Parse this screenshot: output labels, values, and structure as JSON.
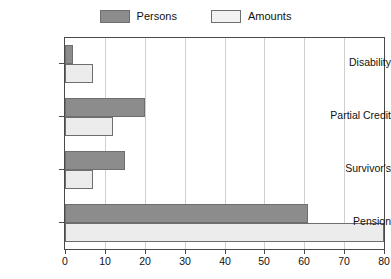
{
  "chart_data": {
    "type": "bar",
    "orientation": "horizontal",
    "title": "",
    "xlabel": "",
    "ylabel": "",
    "categories": [
      "Disability",
      "Partial Credit",
      "Survivor's",
      "Pension"
    ],
    "series": [
      {
        "name": "Persons",
        "values": [
          2,
          20,
          15,
          61
        ],
        "color": "#8c8c8c"
      },
      {
        "name": "Amounts",
        "values": [
          7,
          12,
          7,
          80
        ],
        "color": "#ececec"
      }
    ],
    "xlim": [
      0,
      80
    ],
    "xticks": [
      0,
      10,
      20,
      30,
      40,
      50,
      60,
      70,
      80
    ],
    "xticklabels": [
      "0",
      "10",
      "20",
      "30",
      "40",
      "50",
      "60",
      "70",
      "80"
    ],
    "grid": "vertical",
    "legend_position": "top-center"
  },
  "legend": {
    "entries": [
      {
        "label": "Persons",
        "swatch_color": "#8c8c8c"
      },
      {
        "label": "Amounts",
        "swatch_color": "#f2f2f2"
      }
    ]
  },
  "axes": {
    "x_tick_labels": [
      "0",
      "10",
      "20",
      "30",
      "40",
      "50",
      "60",
      "70",
      "80"
    ],
    "y_category_labels": [
      "Disability",
      "Partial Credit",
      "Survivor's",
      "Pension"
    ]
  },
  "colors": {
    "persons_fill": "#8c8c8c",
    "amounts_fill": "#ececec",
    "bar_stroke": "#6e6e6e",
    "axis": "#4a4a4a",
    "grid": "#cfcfcf",
    "background": "#ffffff"
  }
}
